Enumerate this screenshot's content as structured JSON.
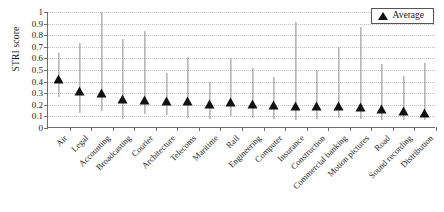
{
  "chart_data": {
    "type": "scatter",
    "title": "",
    "subtitle": "",
    "xlabel": "",
    "ylabel": "STRI score",
    "ylim": [
      0,
      1
    ],
    "ytick_labels": [
      "0",
      "0.1",
      "0.2",
      "0.3",
      "0.4",
      "0.5",
      "0.6",
      "0.7",
      "0.8",
      "0.9",
      "1"
    ],
    "ytick_values": [
      0,
      0.1,
      0.2,
      0.3,
      0.4,
      0.5,
      0.6,
      0.7,
      0.8,
      0.9,
      1
    ],
    "grid": "horizontal-dotted",
    "legend": {
      "position": "top-right",
      "entries": [
        {
          "label": "Average",
          "marker": "triangle-up",
          "color": "#111111"
        }
      ]
    },
    "categories": [
      "Air",
      "Legal",
      "Accounting",
      "Broadcasting",
      "Courier",
      "Architecture",
      "Telecoms",
      "Maritime",
      "Rail",
      "Engineering",
      "Computer",
      "Insurance",
      "Construction",
      "Commercial banking",
      "Motion pictures",
      "Road",
      "Sound recording",
      "Distribution"
    ],
    "series": [
      {
        "name": "Average",
        "marker": "triangle-up",
        "values": [
          0.42,
          0.32,
          0.3,
          0.25,
          0.24,
          0.23,
          0.23,
          0.21,
          0.22,
          0.21,
          0.2,
          0.19,
          0.19,
          0.19,
          0.18,
          0.16,
          0.15,
          0.13
        ]
      },
      {
        "name": "Range (min)",
        "values": [
          0.27,
          0.13,
          0.15,
          0.08,
          0.12,
          0.11,
          0.09,
          0.08,
          0.1,
          0.09,
          0.08,
          0.07,
          0.08,
          0.09,
          0.08,
          0.07,
          0.07,
          0.07
        ]
      },
      {
        "name": "Range (max)",
        "values": [
          0.65,
          0.73,
          1.0,
          0.77,
          0.84,
          0.47,
          0.61,
          0.4,
          0.6,
          0.52,
          0.44,
          0.91,
          0.5,
          0.7,
          0.87,
          0.55,
          0.45,
          0.56
        ]
      }
    ]
  },
  "legend": {
    "average_label": "Average"
  },
  "axis": {
    "y_title": "STRI score"
  }
}
